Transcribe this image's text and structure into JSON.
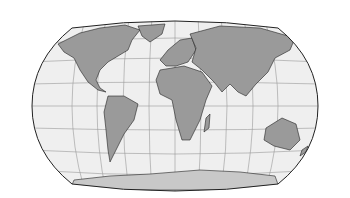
{
  "map": {
    "projection": "Winkel tripel / Robinson-like world map",
    "colors": {
      "background": "#ffffff",
      "ocean": "#efefef",
      "land": "#9a9a9a",
      "antarctica": "#c8c8c8",
      "graticule": "#888888",
      "outline": "#222222"
    },
    "regions": [
      "North America",
      "South America",
      "Europe",
      "Africa",
      "Asia",
      "Australia",
      "Antarctica",
      "Greenland"
    ]
  }
}
